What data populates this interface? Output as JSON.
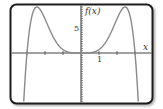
{
  "chart_data": {
    "type": "line",
    "title": "",
    "xlabel": "x",
    "ylabel": "f(x)",
    "x_tick_label": "1",
    "y_tick_label": "5",
    "xlim": [
      -3.9,
      3.9
    ],
    "ylim": [
      -10.8,
      10.6
    ],
    "grid": false,
    "legend": null,
    "x_tick_step": 1,
    "y_tick_step": 0.5,
    "series": [
      {
        "name": "f(x)",
        "color": "#8a8a8a",
        "description": "even polynomial, flat at origin, roots near x=±3, maxima ~10 at x≈±2.45",
        "x": [
          -3.5,
          -3.25,
          -3.0,
          -2.75,
          -2.45,
          -2.0,
          -1.5,
          -1.0,
          -0.5,
          0,
          0.5,
          1.0,
          1.5,
          2.0,
          2.45,
          2.75,
          3.0,
          3.25,
          3.5
        ],
        "y": [
          -36.6,
          -14.1,
          0,
          7.6,
          10.0,
          7.4,
          3.2,
          0.74,
          0.05,
          0,
          0.05,
          0.74,
          3.2,
          7.4,
          10.0,
          7.6,
          0,
          -14.1,
          -36.6
        ]
      }
    ]
  },
  "labels": {
    "y_axis": "f(x)",
    "x_axis": "x",
    "x_tick": "1",
    "y_tick": "5"
  },
  "colors": {
    "frame": "#222222",
    "axes": "#444444",
    "curve": "#8a8a8a"
  }
}
